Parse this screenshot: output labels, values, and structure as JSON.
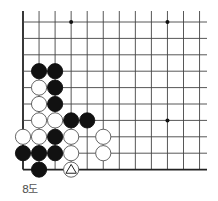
{
  "diagram": {
    "title": "8도",
    "board": {
      "cols": 12,
      "rows": 10,
      "origin_x": 23,
      "origin_y": 22,
      "spacing_x": 16.05,
      "spacing_y": 16.4,
      "left_edge": true,
      "bottom_edge": true,
      "top_open": true,
      "right_open": true,
      "line_color": "#444444",
      "edge_color": "#222222",
      "star_points": [
        [
          3,
          0
        ],
        [
          9,
          0
        ],
        [
          9,
          6
        ]
      ]
    },
    "stones": [
      {
        "col": 1,
        "row": 3,
        "color": "black"
      },
      {
        "col": 2,
        "row": 3,
        "color": "black"
      },
      {
        "col": 1,
        "row": 4,
        "color": "white"
      },
      {
        "col": 2,
        "row": 4,
        "color": "black"
      },
      {
        "col": 1,
        "row": 5,
        "color": "white"
      },
      {
        "col": 2,
        "row": 5,
        "color": "black"
      },
      {
        "col": 1,
        "row": 6,
        "color": "white"
      },
      {
        "col": 2,
        "row": 6,
        "color": "white"
      },
      {
        "col": 3,
        "row": 6,
        "color": "black"
      },
      {
        "col": 4,
        "row": 6,
        "color": "black"
      },
      {
        "col": 0,
        "row": 7,
        "color": "white"
      },
      {
        "col": 1,
        "row": 7,
        "color": "white"
      },
      {
        "col": 2,
        "row": 7,
        "color": "black"
      },
      {
        "col": 3,
        "row": 7,
        "color": "white"
      },
      {
        "col": 5,
        "row": 7,
        "color": "white"
      },
      {
        "col": 0,
        "row": 8,
        "color": "black"
      },
      {
        "col": 1,
        "row": 8,
        "color": "black"
      },
      {
        "col": 2,
        "row": 8,
        "color": "black"
      },
      {
        "col": 3,
        "row": 8,
        "color": "white"
      },
      {
        "col": 5,
        "row": 8,
        "color": "white"
      },
      {
        "col": 1,
        "row": 9,
        "color": "black"
      },
      {
        "col": 3,
        "row": 9,
        "color": "white",
        "mark": "triangle"
      }
    ]
  }
}
